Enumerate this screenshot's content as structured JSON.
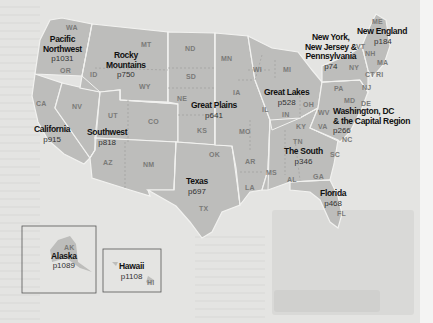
{
  "colors": {
    "background": "#e4e4e2",
    "land": "#bdbdbb",
    "border": "#f2f2f0",
    "region_text": "#111111",
    "state_text": "#7a7a78",
    "inset_border": "#555555"
  },
  "states": {
    "WA": "WA",
    "OR": "OR",
    "CA": "CA",
    "ID": "ID",
    "NV": "NV",
    "MT": "MT",
    "WY": "WY",
    "UT": "UT",
    "CO": "CO",
    "AZ": "AZ",
    "NM": "NM",
    "ND": "ND",
    "SD": "SD",
    "NE": "NE",
    "KS": "KS",
    "OK": "OK",
    "TX": "TX",
    "MN": "MN",
    "IA": "IA",
    "MO": "MO",
    "AR": "AR",
    "LA": "LA",
    "WI": "WI",
    "MI": "MI",
    "IL": "IL",
    "IN": "IN",
    "OH": "OH",
    "KY": "KY",
    "TN": "TN",
    "MS": "MS",
    "AL": "AL",
    "GA": "GA",
    "FL": "FL",
    "SC": "SC",
    "NC": "NC",
    "VA": "VA",
    "WV": "WV",
    "PA": "PA",
    "NY": "NY",
    "NJ": "NJ",
    "MD": "MD",
    "DE": "DE",
    "CT": "CT",
    "RI": "RI",
    "MA": "MA",
    "VT": "VT",
    "NH": "NH",
    "ME": "ME",
    "AK": "AK",
    "HI": "HI"
  },
  "regions": [
    {
      "id": "pacific-northwest",
      "name_lines": [
        "Pacific",
        "Northwest"
      ],
      "page": "p1031"
    },
    {
      "id": "rocky-mountains",
      "name_lines": [
        "Rocky",
        "Mountains"
      ],
      "page": "p750"
    },
    {
      "id": "california",
      "name_lines": [
        "California"
      ],
      "page": "p915"
    },
    {
      "id": "southwest",
      "name_lines": [
        "Southwest"
      ],
      "page": "p818"
    },
    {
      "id": "great-plains",
      "name_lines": [
        "Great Plains"
      ],
      "page": "p641"
    },
    {
      "id": "texas",
      "name_lines": [
        "Texas"
      ],
      "page": "p697"
    },
    {
      "id": "great-lakes",
      "name_lines": [
        "Great Lakes"
      ],
      "page": "p528"
    },
    {
      "id": "new-york-nj-pa",
      "name_lines": [
        "New York,",
        "New Jersey &",
        "Pennsylvania"
      ],
      "page": "p74"
    },
    {
      "id": "new-england",
      "name_lines": [
        "New England"
      ],
      "page": "p184"
    },
    {
      "id": "washington-dc",
      "name_lines": [
        "Washington, DC",
        "& the Capital Region"
      ],
      "page": "p266"
    },
    {
      "id": "the-south",
      "name_lines": [
        "The South"
      ],
      "page": "p346"
    },
    {
      "id": "florida",
      "name_lines": [
        "Florida"
      ],
      "page": "p468"
    },
    {
      "id": "alaska",
      "name_lines": [
        "Alaska"
      ],
      "page": "p1089"
    },
    {
      "id": "hawaii",
      "name_lines": [
        "Hawaii"
      ],
      "page": "p1108"
    }
  ]
}
